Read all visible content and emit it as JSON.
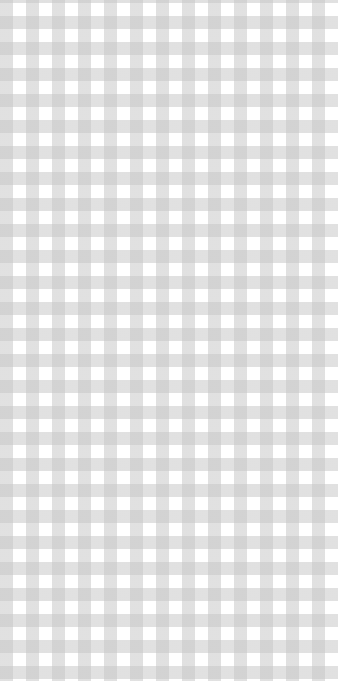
{
  "pattern": {
    "type": "gingham",
    "colors": {
      "base": "#ffffff",
      "stripe": "#d6d6d6",
      "overlap": "#c4c4c4"
    },
    "period_px": 26
  }
}
